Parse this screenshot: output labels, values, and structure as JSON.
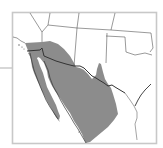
{
  "map": {
    "type": "species-range-map",
    "region": "Southwestern United States and northern Mexico",
    "colors": {
      "background": "#ffffff",
      "frame": "#c8c8c8",
      "range_fill": "#8c8c8c",
      "state_borders": "#555555",
      "coastline": "#333333",
      "leader_line": "#bdbdbd"
    },
    "legend": {
      "range_label": ""
    }
  }
}
